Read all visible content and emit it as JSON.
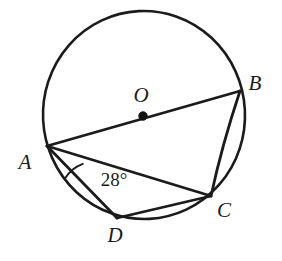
{
  "figure": {
    "background_color": "#ffffff",
    "stroke_color": "#1b1b1b",
    "circle": {
      "name": "circle-O",
      "center_x": 144,
      "center_y": 115,
      "radius": 103
    },
    "center_point": {
      "label": "O",
      "x": 143,
      "y": 116,
      "label_x": 141,
      "label_y": 97,
      "dot_radius": 4.2
    },
    "vertices": [
      {
        "id": "A",
        "label": "A",
        "x": 47,
        "y": 146,
        "label_x": 25,
        "label_y": 164
      },
      {
        "id": "B",
        "label": "B",
        "x": 240,
        "y": 91,
        "label_x": 255,
        "label_y": 85
      },
      {
        "id": "C",
        "label": "C",
        "x": 211,
        "y": 196,
        "label_x": 224,
        "label_y": 212
      },
      {
        "id": "D",
        "label": "D",
        "x": 117,
        "y": 218,
        "label_x": 115,
        "label_y": 237
      }
    ],
    "segments": [
      {
        "id": "AB",
        "name": "diameter-a-b",
        "from": "A",
        "to": "B"
      },
      {
        "id": "AC",
        "name": "chord-a-c",
        "from": "A",
        "to": "C"
      },
      {
        "id": "AD",
        "name": "chord-a-d",
        "from": "A",
        "to": "D"
      },
      {
        "id": "DC",
        "name": "chord-d-c",
        "from": "D",
        "to": "C"
      },
      {
        "id": "BC",
        "name": "chord-b-c",
        "from": "B",
        "to": "C"
      }
    ],
    "angle_marks": [
      {
        "id": "angle-DAC",
        "vertex": "A",
        "label": "28°",
        "label_x": 114,
        "label_y": 182,
        "arc_radius": 36,
        "arc_path": "M 82.8 163.8 A 36 36 0 0 0 64.7 178.7"
      }
    ]
  }
}
